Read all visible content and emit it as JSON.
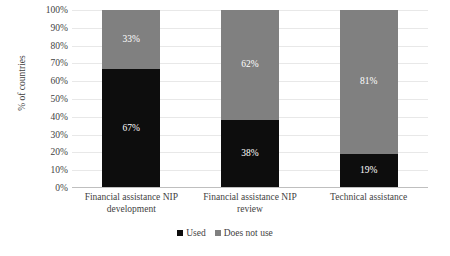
{
  "chart_data": {
    "type": "bar",
    "subtype": "stacked-100-percent",
    "title": "",
    "xlabel": "",
    "ylabel": "% of countries",
    "ylim": [
      0,
      100
    ],
    "ytick_labels": [
      "100%",
      "90%",
      "80%",
      "70%",
      "60%",
      "50%",
      "40%",
      "30%",
      "20%",
      "10%",
      "0%"
    ],
    "ytick_values": [
      100,
      90,
      80,
      70,
      60,
      50,
      40,
      30,
      20,
      10,
      0
    ],
    "grid": true,
    "legend_position": "bottom-center",
    "categories": [
      "Financial assistance NIP development",
      "Financial assistance NIP review",
      "Technical assistance"
    ],
    "category_lines": [
      [
        "Financial assistance NIP",
        "development"
      ],
      [
        "Financial assistance NIP",
        "review"
      ],
      [
        "Technical assistance"
      ]
    ],
    "series": [
      {
        "name": "Used",
        "color": "#0d0d0d",
        "values": [
          67,
          38,
          19
        ],
        "labels": [
          "67%",
          "38%",
          "19%"
        ]
      },
      {
        "name": "Does not use",
        "color": "#808080",
        "values": [
          33,
          62,
          81
        ],
        "labels": [
          "33%",
          "62%",
          "81%"
        ]
      }
    ]
  },
  "legend": {
    "items": [
      {
        "label": "Used",
        "color": "#0d0d0d"
      },
      {
        "label": "Does not use",
        "color": "#808080"
      }
    ]
  },
  "colors": {
    "used": "#0d0d0d",
    "does_not_use": "#808080",
    "gridline": "#e8e8e8",
    "axis": "#bfbfbf",
    "text": "#3f3f3f",
    "label_text": "#ffffff",
    "background": "#ffffff"
  }
}
